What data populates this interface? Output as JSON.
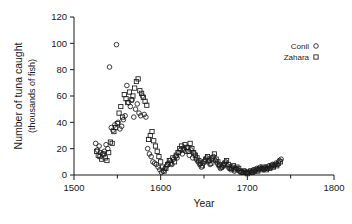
{
  "chart_data": {
    "type": "scatter",
    "title": "",
    "xlabel": "Year",
    "ylabel_line1": "Number of tuna caught",
    "ylabel_line2": "(thousands of fish)",
    "xlim": [
      1500,
      1800
    ],
    "ylim": [
      0,
      120
    ],
    "xticks": [
      1500,
      1600,
      1700,
      1800
    ],
    "xticks_minor": [
      1550,
      1650,
      1750
    ],
    "yticks": [
      0,
      20,
      40,
      60,
      80,
      100,
      120
    ],
    "grid": false,
    "legend_position": "top-right",
    "series": [
      {
        "name": "Conil",
        "marker": "circle",
        "points": [
          [
            1525,
            24
          ],
          [
            1527,
            19
          ],
          [
            1529,
            22
          ],
          [
            1531,
            17
          ],
          [
            1533,
            16
          ],
          [
            1535,
            18
          ],
          [
            1537,
            23
          ],
          [
            1539,
            20
          ],
          [
            1541,
            82
          ],
          [
            1543,
            36
          ],
          [
            1545,
            34
          ],
          [
            1547,
            38
          ],
          [
            1549,
            99
          ],
          [
            1551,
            40
          ],
          [
            1553,
            35
          ],
          [
            1555,
            37
          ],
          [
            1557,
            42
          ],
          [
            1559,
            45
          ],
          [
            1561,
            68
          ],
          [
            1563,
            55
          ],
          [
            1565,
            52
          ],
          [
            1567,
            57
          ],
          [
            1569,
            44
          ],
          [
            1571,
            50
          ],
          [
            1573,
            54
          ],
          [
            1575,
            47
          ],
          [
            1577,
            45
          ],
          [
            1579,
            60
          ],
          [
            1581,
            46
          ],
          [
            1583,
            44
          ],
          [
            1585,
            20
          ],
          [
            1587,
            16
          ],
          [
            1589,
            14
          ],
          [
            1591,
            10
          ],
          [
            1593,
            9
          ],
          [
            1595,
            8
          ],
          [
            1597,
            6
          ],
          [
            1599,
            4
          ],
          [
            1601,
            2
          ],
          [
            1603,
            3
          ],
          [
            1605,
            5
          ],
          [
            1607,
            7
          ],
          [
            1609,
            9
          ],
          [
            1611,
            11
          ],
          [
            1613,
            8
          ],
          [
            1615,
            12
          ],
          [
            1617,
            14
          ],
          [
            1619,
            13
          ],
          [
            1621,
            17
          ],
          [
            1623,
            19
          ],
          [
            1625,
            16
          ],
          [
            1627,
            20
          ],
          [
            1629,
            18
          ],
          [
            1631,
            21
          ],
          [
            1633,
            15
          ],
          [
            1635,
            19
          ],
          [
            1637,
            13
          ],
          [
            1639,
            16
          ],
          [
            1641,
            12
          ],
          [
            1643,
            10
          ],
          [
            1645,
            8
          ],
          [
            1647,
            6
          ],
          [
            1649,
            9
          ],
          [
            1651,
            11
          ],
          [
            1653,
            13
          ],
          [
            1655,
            10
          ],
          [
            1657,
            8
          ],
          [
            1659,
            12
          ],
          [
            1661,
            14
          ],
          [
            1663,
            11
          ],
          [
            1665,
            9
          ],
          [
            1667,
            7
          ],
          [
            1669,
            5
          ],
          [
            1671,
            6
          ],
          [
            1673,
            8
          ],
          [
            1675,
            10
          ],
          [
            1677,
            7
          ],
          [
            1679,
            5
          ],
          [
            1681,
            4
          ],
          [
            1683,
            6
          ],
          [
            1685,
            3
          ],
          [
            1687,
            5
          ],
          [
            1689,
            4
          ],
          [
            1691,
            3
          ],
          [
            1693,
            2
          ],
          [
            1695,
            2
          ],
          [
            1697,
            3
          ],
          [
            1699,
            2
          ],
          [
            1701,
            2
          ],
          [
            1703,
            3
          ],
          [
            1705,
            2
          ],
          [
            1707,
            4
          ],
          [
            1709,
            3
          ],
          [
            1711,
            5
          ],
          [
            1713,
            4
          ],
          [
            1715,
            6
          ],
          [
            1717,
            5
          ],
          [
            1719,
            4
          ],
          [
            1721,
            6
          ],
          [
            1723,
            5
          ],
          [
            1725,
            7
          ],
          [
            1727,
            6
          ],
          [
            1729,
            8
          ],
          [
            1731,
            7
          ],
          [
            1733,
            9
          ],
          [
            1735,
            8
          ],
          [
            1737,
            11
          ],
          [
            1739,
            12
          ]
        ]
      },
      {
        "name": "Zahara",
        "marker": "square",
        "points": [
          [
            1526,
            18
          ],
          [
            1528,
            15
          ],
          [
            1530,
            14
          ],
          [
            1532,
            12
          ],
          [
            1534,
            16
          ],
          [
            1536,
            13
          ],
          [
            1538,
            11
          ],
          [
            1540,
            17
          ],
          [
            1542,
            25
          ],
          [
            1544,
            24
          ],
          [
            1546,
            33
          ],
          [
            1548,
            36
          ],
          [
            1550,
            39
          ],
          [
            1552,
            47
          ],
          [
            1554,
            52
          ],
          [
            1556,
            44
          ],
          [
            1558,
            61
          ],
          [
            1560,
            58
          ],
          [
            1562,
            55
          ],
          [
            1564,
            63
          ],
          [
            1566,
            57
          ],
          [
            1568,
            60
          ],
          [
            1570,
            66
          ],
          [
            1572,
            71
          ],
          [
            1574,
            73
          ],
          [
            1576,
            64
          ],
          [
            1578,
            62
          ],
          [
            1580,
            59
          ],
          [
            1582,
            56
          ],
          [
            1584,
            53
          ],
          [
            1586,
            27
          ],
          [
            1588,
            30
          ],
          [
            1590,
            33
          ],
          [
            1592,
            26
          ],
          [
            1594,
            22
          ],
          [
            1596,
            18
          ],
          [
            1598,
            14
          ],
          [
            1600,
            10
          ],
          [
            1602,
            6
          ],
          [
            1604,
            3
          ],
          [
            1606,
            5
          ],
          [
            1608,
            8
          ],
          [
            1610,
            11
          ],
          [
            1612,
            9
          ],
          [
            1614,
            13
          ],
          [
            1616,
            10
          ],
          [
            1618,
            15
          ],
          [
            1620,
            17
          ],
          [
            1622,
            20
          ],
          [
            1624,
            22
          ],
          [
            1626,
            19
          ],
          [
            1628,
            23
          ],
          [
            1630,
            21
          ],
          [
            1632,
            18
          ],
          [
            1634,
            24
          ],
          [
            1636,
            20
          ],
          [
            1638,
            17
          ],
          [
            1640,
            15
          ],
          [
            1642,
            13
          ],
          [
            1644,
            11
          ],
          [
            1646,
            9
          ],
          [
            1648,
            7
          ],
          [
            1650,
            10
          ],
          [
            1652,
            12
          ],
          [
            1654,
            14
          ],
          [
            1656,
            11
          ],
          [
            1658,
            9
          ],
          [
            1660,
            13
          ],
          [
            1662,
            16
          ],
          [
            1664,
            12
          ],
          [
            1666,
            10
          ],
          [
            1668,
            8
          ],
          [
            1670,
            6
          ],
          [
            1672,
            7
          ],
          [
            1674,
            9
          ],
          [
            1676,
            11
          ],
          [
            1678,
            8
          ],
          [
            1680,
            6
          ],
          [
            1682,
            5
          ],
          [
            1684,
            7
          ],
          [
            1686,
            4
          ],
          [
            1688,
            6
          ],
          [
            1690,
            5
          ],
          [
            1692,
            3
          ],
          [
            1694,
            2
          ],
          [
            1696,
            3
          ],
          [
            1698,
            2
          ],
          [
            1700,
            1
          ],
          [
            1702,
            2
          ],
          [
            1704,
            3
          ],
          [
            1706,
            2
          ],
          [
            1708,
            3
          ],
          [
            1710,
            4
          ],
          [
            1712,
            3
          ],
          [
            1714,
            5
          ],
          [
            1716,
            4
          ],
          [
            1718,
            6
          ],
          [
            1720,
            5
          ],
          [
            1722,
            4
          ],
          [
            1724,
            6
          ],
          [
            1726,
            5
          ],
          [
            1728,
            7
          ],
          [
            1730,
            6
          ],
          [
            1732,
            8
          ],
          [
            1734,
            7
          ],
          [
            1736,
            9
          ],
          [
            1738,
            10
          ]
        ]
      }
    ]
  },
  "legend": {
    "items": [
      {
        "label": "Conil",
        "marker": "circle"
      },
      {
        "label": "Zahara",
        "marker": "square"
      }
    ]
  },
  "colors": {
    "axis": "#1a1a1a",
    "marker": "#1a1a1a",
    "background": "#ffffff"
  }
}
